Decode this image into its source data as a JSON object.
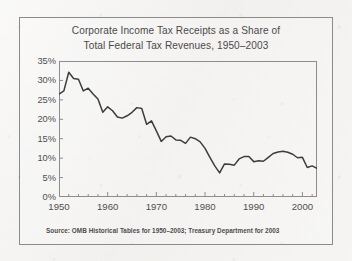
{
  "figure": {
    "title_line_1": "Corporate Income Tax Receipts as a Share of",
    "title_line_2": "Total Federal Tax Revenues, 1950–2003",
    "source_note": "Source: OMB Historical Tables for 1950–2003; Treasury Department for 2003",
    "line_color": "#3d3d3d",
    "frame_color": "#8b8b8b",
    "text_color": "#4a4a4a",
    "background_color": "#f3f2f0"
  },
  "chart_data": {
    "type": "line",
    "title": "Corporate Income Tax Receipts as a Share of Total Federal Tax Revenues, 1950–2003",
    "xlabel": "",
    "ylabel": "",
    "xlim": [
      1950,
      2003
    ],
    "ylim": [
      0,
      35
    ],
    "grid": false,
    "legend": false,
    "y_tick_labels": [
      "35%",
      "30%",
      "25%",
      "20%",
      "15%",
      "10%",
      "5%",
      "0%"
    ],
    "y_ticks": [
      35,
      30,
      25,
      20,
      15,
      10,
      5,
      0
    ],
    "x_tick_labels": [
      "1950",
      "1960",
      "1970",
      "1980",
      "1990",
      "2000"
    ],
    "x_ticks": [
      1950,
      1960,
      1970,
      1980,
      1990,
      2000
    ],
    "x_minor_tick_interval": 2,
    "y_unit": "percent",
    "series": [
      {
        "name": "Corporate income tax receipts as share of total federal tax revenues",
        "x": [
          1950,
          1951,
          1952,
          1953,
          1954,
          1955,
          1956,
          1957,
          1958,
          1959,
          1960,
          1961,
          1962,
          1963,
          1964,
          1965,
          1966,
          1967,
          1968,
          1969,
          1970,
          1971,
          1972,
          1973,
          1974,
          1975,
          1976,
          1977,
          1978,
          1979,
          1980,
          1981,
          1982,
          1983,
          1984,
          1985,
          1986,
          1987,
          1988,
          1989,
          1990,
          1991,
          1992,
          1993,
          1994,
          1995,
          1996,
          1997,
          1998,
          1999,
          2000,
          2001,
          2002,
          2003
        ],
        "values": [
          26.5,
          27.3,
          32.1,
          30.5,
          30.3,
          27.3,
          28.0,
          26.5,
          25.2,
          21.8,
          23.2,
          22.2,
          20.6,
          20.3,
          20.9,
          21.8,
          23.0,
          22.8,
          18.7,
          19.6,
          17.0,
          14.3,
          15.5,
          15.7,
          14.7,
          14.6,
          13.8,
          15.4,
          15.0,
          14.2,
          12.5,
          10.2,
          8.0,
          6.2,
          8.5,
          8.4,
          8.2,
          9.8,
          10.4,
          10.4,
          9.1,
          9.3,
          9.2,
          10.2,
          11.2,
          11.6,
          11.8,
          11.5,
          11.0,
          10.1,
          10.2,
          7.6,
          8.0,
          7.4
        ]
      }
    ]
  }
}
